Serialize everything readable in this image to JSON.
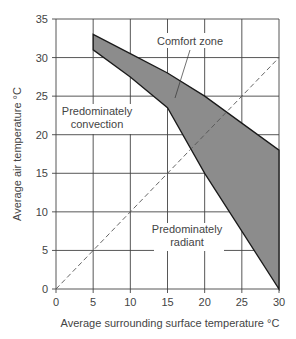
{
  "chart_data": {
    "type": "area",
    "title": "",
    "xlabel": "Average surrounding surface temperature °C",
    "ylabel": "Average air temperature °C",
    "xlim": [
      0,
      30
    ],
    "ylim": [
      0,
      35
    ],
    "x_ticks": [
      "0",
      "5",
      "10",
      "15",
      "20",
      "25",
      "30"
    ],
    "y_ticks": [
      "0",
      "5",
      "10",
      "15",
      "20",
      "25",
      "30",
      "35"
    ],
    "grid": true,
    "series": [
      {
        "name": "Comfort zone upper bound",
        "x": [
          5,
          10,
          15,
          20,
          25,
          30
        ],
        "values": [
          33,
          30.5,
          28,
          25,
          21.5,
          18
        ]
      },
      {
        "name": "Comfort zone lower bound",
        "x": [
          5,
          10,
          15,
          20,
          25,
          30
        ],
        "values": [
          31,
          27.5,
          23.5,
          15,
          7.5,
          0
        ]
      },
      {
        "name": "Equal temperature line (dashed)",
        "x": [
          0,
          30
        ],
        "values": [
          0,
          30
        ]
      }
    ],
    "annotations": [
      {
        "text": "Comfort zone",
        "x": 20,
        "y": 31
      },
      {
        "text": "Predominately convection",
        "x": 5,
        "y": 23
      },
      {
        "text": "Predominately radiant",
        "x": 17.5,
        "y": 7
      }
    ],
    "colors": {
      "fill": "#8c8c8c",
      "line": "#1a1a1a",
      "grid": "#444444"
    }
  },
  "labels": {
    "comfort_zone": "Comfort zone",
    "convection_1": "Predominately",
    "convection_2": "convection",
    "radiant_1": "Predominately",
    "radiant_2": "radiant",
    "xlabel": "Average surrounding surface temperature °C",
    "ylabel": "Average air temperature °C"
  }
}
